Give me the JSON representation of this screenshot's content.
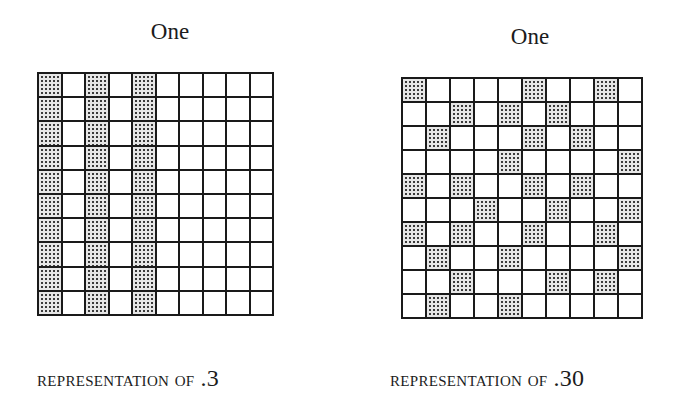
{
  "figures": [
    {
      "title": "One",
      "caption_prefix": "REPRESENTATION OF",
      "caption_value": ".3",
      "grid": {
        "rows": 10,
        "cols": 10,
        "shaded_count": 30,
        "shaded_cells_by_row": [
          [
            0,
            2,
            4
          ],
          [
            0,
            2,
            4
          ],
          [
            0,
            2,
            4
          ],
          [
            0,
            2,
            4
          ],
          [
            0,
            2,
            4
          ],
          [
            0,
            2,
            4
          ],
          [
            0,
            2,
            4
          ],
          [
            0,
            2,
            4
          ],
          [
            0,
            2,
            4
          ],
          [
            0,
            2,
            4
          ]
        ]
      }
    },
    {
      "title": "One",
      "caption_prefix": "REPRESENTATION OF",
      "caption_value": ".30",
      "grid": {
        "rows": 10,
        "cols": 10,
        "shaded_count": 30,
        "shaded_cells_by_row": [
          [
            0,
            5,
            8
          ],
          [
            2,
            4,
            6
          ],
          [
            1,
            5,
            7
          ],
          [
            4,
            9
          ],
          [
            0,
            2,
            5,
            7
          ],
          [
            3,
            6,
            9
          ],
          [
            0,
            2,
            5,
            8
          ],
          [
            1,
            4,
            9
          ],
          [
            2,
            6,
            8
          ],
          [
            1,
            4
          ]
        ]
      }
    }
  ],
  "colors": {
    "grid_line": "#1a1a1a",
    "shaded_fill": "#e6e6e6",
    "shaded_dot": "#3a3a3a",
    "background": "#ffffff"
  }
}
